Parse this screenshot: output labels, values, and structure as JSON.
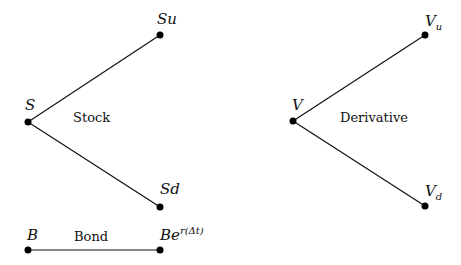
{
  "stock_tree": {
    "title": "Stock",
    "root": {
      "label": "S",
      "x": 28,
      "y": 122
    },
    "up": {
      "label": "Su",
      "x": 160,
      "y": 35
    },
    "down": {
      "label": "Sd",
      "x": 160,
      "y": 207
    }
  },
  "derivative_tree": {
    "title": "Derivative",
    "root": {
      "label": "V",
      "x": 293,
      "y": 121
    },
    "up": {
      "label_base": "V",
      "label_sub": "u",
      "x": 425,
      "y": 35
    },
    "down": {
      "label_base": "V",
      "label_sub": "d",
      "x": 425,
      "y": 206
    }
  },
  "bond": {
    "title": "Bond",
    "start": {
      "label": "B",
      "x": 28,
      "y": 250
    },
    "end": {
      "label_base": "Be",
      "label_sup": "r(Δt)",
      "x": 160,
      "y": 250
    }
  },
  "colors": {
    "line": "#111111",
    "node": "#000000",
    "background": "#ffffff"
  }
}
